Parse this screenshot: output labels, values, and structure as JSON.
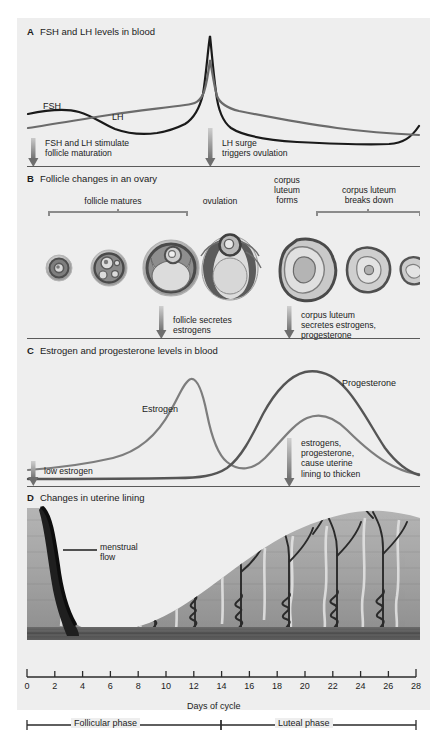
{
  "figure": {
    "background": "#eeeeee",
    "panels": [
      {
        "letter": "A",
        "title": "FSH and LH levels in blood",
        "curve_labels": [
          "FSH",
          "LH"
        ],
        "callouts": [
          "FSH and LH stimulate\nfollicle maturation",
          "LH surge\ntriggers ovulation"
        ]
      },
      {
        "letter": "B",
        "title": "Follicle changes in an ovary",
        "bracket_labels": [
          "follicle matures",
          "ovulation",
          "corpus\nluteum\nforms",
          "corpus luteum\nbreaks down"
        ],
        "callouts": [
          "follicle secretes\nestrogens",
          "corpus luteum\nsecretes estrogens,\nprogesterone"
        ]
      },
      {
        "letter": "C",
        "title": "Estrogen and progesterone levels in blood",
        "curve_labels": [
          "Estrogen",
          "Progesterone"
        ],
        "callouts": [
          "low estrogen",
          "estrogens,\nprogesterone,\ncause uterine\nlining to thicken"
        ]
      },
      {
        "letter": "D",
        "title": "Changes in uterine lining",
        "annotations": [
          "menstrual\nflow"
        ]
      }
    ]
  },
  "axis": {
    "label": "Days of cycle",
    "ticks": [
      0,
      2,
      4,
      6,
      8,
      10,
      12,
      14,
      16,
      18,
      20,
      22,
      24,
      26,
      28
    ],
    "min": 0,
    "max": 28,
    "phases": [
      {
        "name": "Follicular phase",
        "start": 0,
        "end": 14
      },
      {
        "name": "Luteal phase",
        "start": 14,
        "end": 28
      }
    ]
  },
  "colors": {
    "background": "#eeeeee",
    "page": "#ffffff",
    "ink": "#1b1b1b",
    "fsh_curve": "#1a1a1a",
    "lh_curve": "#6b6b6b",
    "estrogen_curve": "#7d7d7d",
    "progesterone_curve": "#555555",
    "arrow": "#8c8c8c",
    "rule": "#5a5a5a",
    "tissue": "#a9a9a9",
    "tissue_dark": "#4a4a4a"
  },
  "chart_data": [
    {
      "type": "line",
      "title": "FSH and LH levels in blood",
      "xlabel": "Days of cycle",
      "ylabel": "",
      "xlim": [
        0,
        28
      ],
      "grid": false,
      "legend_position": "inline",
      "x": [
        0,
        2,
        4,
        6,
        8,
        10,
        12,
        13,
        13.6,
        14,
        14.4,
        15,
        16,
        18,
        20,
        22,
        24,
        26,
        28
      ],
      "series": [
        {
          "name": "FSH",
          "values": [
            62,
            60,
            58,
            62,
            70,
            76,
            76,
            62,
            22,
            12,
            30,
            58,
            68,
            74,
            78,
            80,
            80,
            74,
            52
          ]
        },
        {
          "name": "LH",
          "values": [
            76,
            74,
            70,
            66,
            62,
            58,
            54,
            40,
            14,
            4,
            16,
            40,
            56,
            66,
            70,
            74,
            76,
            76,
            66
          ]
        }
      ]
    },
    {
      "type": "line",
      "title": "Estrogen and progesterone levels in blood",
      "xlabel": "Days of cycle",
      "ylabel": "",
      "xlim": [
        0,
        28
      ],
      "grid": false,
      "legend_position": "inline",
      "x": [
        0,
        2,
        4,
        6,
        8,
        10,
        12,
        13,
        14,
        15,
        16,
        18,
        20,
        21,
        22,
        24,
        26,
        28
      ],
      "series": [
        {
          "name": "Estrogen",
          "values": [
            14,
            15,
            17,
            20,
            26,
            38,
            66,
            76,
            70,
            42,
            26,
            32,
            48,
            54,
            54,
            46,
            30,
            20
          ]
        },
        {
          "name": "Progesterone",
          "values": [
            4,
            4,
            4,
            4,
            4,
            4,
            5,
            6,
            10,
            26,
            48,
            76,
            88,
            90,
            86,
            66,
            36,
            16
          ]
        }
      ]
    }
  ]
}
